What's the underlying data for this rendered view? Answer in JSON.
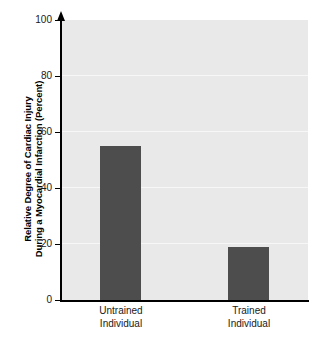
{
  "chart_data": {
    "type": "bar",
    "title": "",
    "subtitle": "",
    "categories": [
      "Untrained Individual",
      "Trained Individual"
    ],
    "category_lines": [
      [
        "Untrained",
        "Individual"
      ],
      [
        "Trained",
        "Individual"
      ]
    ],
    "values": [
      55,
      19
    ],
    "xlabel": "",
    "ylabel_lines": [
      "Relative Degree of Cardiac Injury",
      "During a Myocardial Infarction (Percent)"
    ],
    "ylabel": "Relative Degree of Cardiac Injury During a Myocardial Infarction (Percent)",
    "ylim": [
      0,
      100
    ],
    "yticks": [
      100,
      80,
      60,
      40,
      20,
      0
    ],
    "ytick_labels": [
      "100",
      "80",
      "60",
      "40",
      "20",
      "0"
    ],
    "grid": true,
    "grid_orientation": "horizontal",
    "legend": false,
    "legend_position": "none",
    "colors": {
      "bar": "#4d4d4d",
      "plot_background": "#e9e9e9",
      "gridline": "#f7f7f7",
      "axis": "#000000",
      "text": "#1a1a1a",
      "figure_background": "#ffffff"
    },
    "axis_arrow_top": true
  }
}
